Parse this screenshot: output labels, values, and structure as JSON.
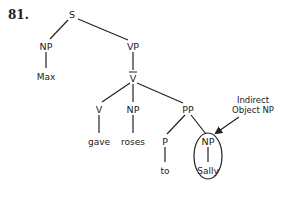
{
  "example_number": "81.",
  "tree": {
    "root": "S",
    "subject_np": "NP",
    "subject_word": "Max",
    "vp": "VP",
    "vbar": "V",
    "verb": "V",
    "verb_word": "gave",
    "direct_object_np": "NP",
    "direct_object_word": "roses",
    "pp": "PP",
    "prep": "P",
    "prep_word": "to",
    "indirect_object_np": "NP",
    "indirect_object_word": "Sally"
  },
  "annotation": {
    "line1": "Indirect",
    "line2": "Object NP"
  },
  "colors": {
    "ink": "#222222",
    "background": "#ffffff"
  }
}
